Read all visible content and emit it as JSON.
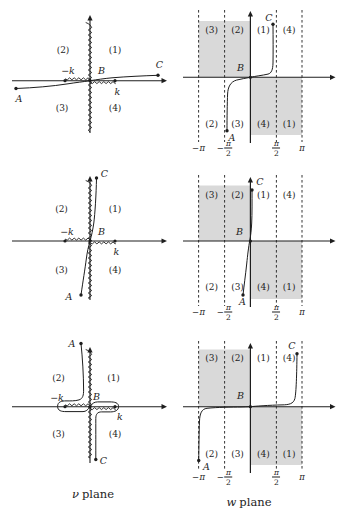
{
  "figure": {
    "colors": {
      "line": "#1e1e1e",
      "shade": "#d9d9d9",
      "background": "#ffffff"
    },
    "captions": {
      "left_symbol": "ν",
      "left_word": "plane",
      "right_symbol": "w",
      "right_word": "plane"
    },
    "rows": [
      {
        "nu": {
          "quadrant_labels": [
            "(1)",
            "(2)",
            "(3)",
            "(4)"
          ],
          "point_labels": {
            "A": "A",
            "B": "B",
            "C": "C",
            "minus_k": "−k",
            "k": "k"
          }
        },
        "w": {
          "band_labels_top": [
            "(3)",
            "(2)",
            "(1)",
            "(4)"
          ],
          "band_labels_bottom": [
            "(2)",
            "(3)",
            "(4)",
            "(1)"
          ],
          "point_labels": {
            "A": "A",
            "B": "B",
            "C": "C"
          },
          "ticks": [
            {
              "sign": "−",
              "num": "π",
              "den": ""
            },
            {
              "sign": "−",
              "num": "π",
              "den": "2"
            },
            {
              "sign": "",
              "num": "π",
              "den": "2"
            },
            {
              "sign": "",
              "num": "π",
              "den": ""
            }
          ]
        }
      },
      {
        "nu": {
          "quadrant_labels": [
            "(1)",
            "(2)",
            "(3)",
            "(4)"
          ],
          "point_labels": {
            "A": "A",
            "B": "B",
            "C": "C",
            "minus_k": "−k",
            "k": "k"
          }
        },
        "w": {
          "band_labels_top": [
            "(3)",
            "(2)",
            "(1)",
            "(4)"
          ],
          "band_labels_bottom": [
            "(2)",
            "(3)",
            "(4)",
            "(1)"
          ],
          "point_labels": {
            "A": "A",
            "B": "B",
            "C": "C"
          },
          "ticks": [
            {
              "sign": "−",
              "num": "π",
              "den": ""
            },
            {
              "sign": "−",
              "num": "π",
              "den": "2"
            },
            {
              "sign": "",
              "num": "π",
              "den": "2"
            },
            {
              "sign": "",
              "num": "π",
              "den": ""
            }
          ]
        }
      },
      {
        "nu": {
          "quadrant_labels": [
            "(1)",
            "(2)",
            "(3)",
            "(4)"
          ],
          "point_labels": {
            "A": "A",
            "B": "B",
            "C": "C",
            "minus_k": "−k",
            "k": "k"
          }
        },
        "w": {
          "band_labels_top": [
            "(3)",
            "(2)",
            "(1)",
            "(4)"
          ],
          "band_labels_bottom": [
            "(2)",
            "(3)",
            "(4)",
            "(1)"
          ],
          "point_labels": {
            "A": "A",
            "B": "B",
            "C": "C"
          },
          "ticks": [
            {
              "sign": "−",
              "num": "π",
              "den": ""
            },
            {
              "sign": "−",
              "num": "π",
              "den": "2"
            },
            {
              "sign": "",
              "num": "π",
              "den": "2"
            },
            {
              "sign": "",
              "num": "π",
              "den": ""
            }
          ]
        }
      }
    ]
  }
}
